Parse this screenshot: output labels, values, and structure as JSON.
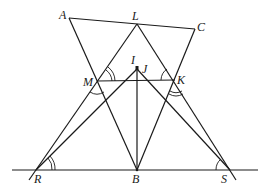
{
  "figure": {
    "type": "geometry-diagram",
    "labels": {
      "A": "A",
      "L": "L",
      "C": "C",
      "M": "M",
      "I": "I",
      "J": "J",
      "K": "K",
      "R": "R",
      "B": "B",
      "S": "S"
    },
    "points": {
      "A": [
        69,
        18
      ],
      "L": [
        137,
        24
      ],
      "C": [
        195,
        29
      ],
      "M": [
        97,
        81
      ],
      "K": [
        175,
        80
      ],
      "IJ": [
        137,
        69
      ],
      "R": [
        36,
        170
      ],
      "B": [
        137,
        170
      ],
      "S": [
        230,
        170
      ]
    },
    "segments": [
      [
        "A",
        "C"
      ],
      [
        "A",
        "B"
      ],
      [
        "L",
        "R"
      ],
      [
        "L",
        "S"
      ],
      [
        "C",
        "B"
      ],
      [
        "M",
        "K"
      ],
      [
        "R",
        "IJ"
      ],
      [
        "S",
        "IJ"
      ],
      [
        "B",
        "IJ"
      ],
      [
        "baseline-left",
        "baseline-right"
      ]
    ],
    "angle_marks": [
      "angle-at-M-upper (double)",
      "angle-at-M-lower",
      "angle-at-K-upper",
      "angle-at-K-lower (double)",
      "angle-at-R (double)",
      "angle-at-S"
    ]
  }
}
